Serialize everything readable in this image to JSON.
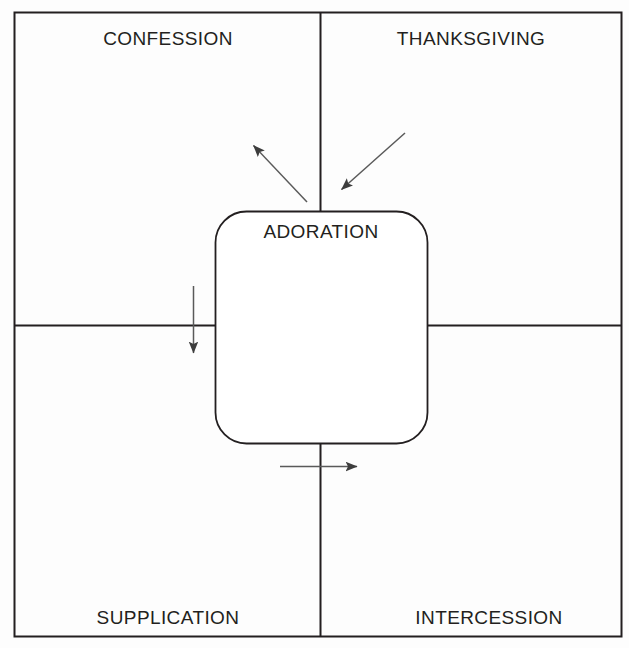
{
  "diagram": {
    "type": "quadrant-diagram",
    "center": {
      "label": "ADORATION",
      "shape": "rounded-rectangle"
    },
    "quadrants": [
      {
        "id": "top-left",
        "label": "CONFESSION"
      },
      {
        "id": "top-right",
        "label": "THANKSGIVING"
      },
      {
        "id": "bottom-left",
        "label": "SUPPLICATION"
      },
      {
        "id": "bottom-right",
        "label": "INTERCESSION"
      }
    ],
    "arrows": [
      {
        "id": "adoration-to-confession",
        "from": "ADORATION",
        "to": "CONFESSION",
        "direction": "up-left"
      },
      {
        "id": "thanksgiving-to-adoration",
        "from": "THANKSGIVING",
        "to": "ADORATION",
        "direction": "down-left"
      },
      {
        "id": "adoration-to-supplication",
        "from": "ADORATION",
        "to": "SUPPLICATION",
        "direction": "down"
      },
      {
        "id": "adoration-to-intercession",
        "from": "ADORATION",
        "to": "INTERCESSION",
        "direction": "right"
      }
    ],
    "colors": {
      "stroke": "#231f20",
      "arrow": "#4a4a4a",
      "text": "#231f20",
      "background": "#fdfdfd"
    }
  }
}
